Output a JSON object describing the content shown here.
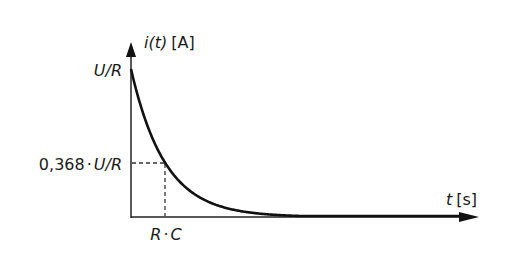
{
  "chart_data": {
    "type": "line",
    "title": "",
    "xlabel": "t [s]",
    "ylabel": "i(t) [A]",
    "function": "i(t) = (U/R) * exp(-t/(R*C))",
    "series": [
      {
        "name": "i(t)",
        "x_in_tau": [
          0,
          0.5,
          1,
          2,
          3,
          4,
          5
        ],
        "values_in_U_over_R": [
          1.0,
          0.607,
          0.368,
          0.135,
          0.05,
          0.018,
          0.007
        ]
      }
    ],
    "annotations": [
      {
        "type": "hline-dashed",
        "y_label": "0,368 · U/R",
        "y": 0.368
      },
      {
        "type": "vline-dashed",
        "x_label": "R · C",
        "x": 1
      }
    ],
    "y_ticks": [
      "U/R",
      "0,368 · U/R"
    ],
    "x_ticks": [
      "R · C"
    ],
    "grid": false,
    "legend": null
  },
  "labels": {
    "y_axis_var": "i(t)",
    "y_axis_unit": "[A]",
    "x_axis_var": "t",
    "x_axis_unit": "[s]",
    "y_max_u": "U",
    "y_max_slash": "/",
    "y_max_r": "R",
    "y_tau_num": "0,368",
    "y_tau_dot": "·",
    "y_tau_u": "U",
    "y_tau_slash": "/",
    "y_tau_r": "R",
    "x_tau_r": "R",
    "x_tau_dot": "·",
    "x_tau_c": "C"
  },
  "colors": {
    "curve": "#111111",
    "axes": "#222222",
    "dashed": "#333333"
  }
}
